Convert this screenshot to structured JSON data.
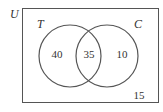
{
  "diagram": {
    "type": "venn",
    "universe_label": "U",
    "sets": [
      {
        "label": "T",
        "only": "40"
      },
      {
        "label": "C",
        "only": "10"
      }
    ],
    "intersection": "35",
    "outside": "15"
  },
  "colors": {
    "stroke": "#555555",
    "text": "#333333"
  }
}
